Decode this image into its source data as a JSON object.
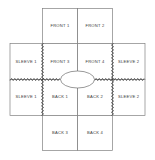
{
  "diagram": {
    "shape": "cruciform",
    "background_color": "#ffffff",
    "line_color": "#808080",
    "seam_color": "#2e2e2e",
    "label_color": "#3a3a3a",
    "neck_opening": {
      "name": "neck-opening",
      "shape": "ellipse",
      "cx": 77.5,
      "cy": 79.5,
      "rx": 17,
      "ry": 8.5
    },
    "panels": [
      {
        "id": "front-1",
        "label": "FRONT 1",
        "x": 42.5,
        "y": 8.5,
        "w": 35,
        "h": 35,
        "cx": 60,
        "cy": 26
      },
      {
        "id": "front-2",
        "label": "FRONT 2",
        "x": 77.5,
        "y": 8.5,
        "w": 35,
        "h": 35,
        "cx": 95,
        "cy": 26
      },
      {
        "id": "sleeve-1-upper",
        "label": "SLEEVE 1",
        "x": 10,
        "y": 43.5,
        "w": 32.5,
        "h": 36,
        "cx": 26.2,
        "cy": 62
      },
      {
        "id": "front-3",
        "label": "FRONT 3",
        "x": 42.5,
        "y": 43.5,
        "w": 35,
        "h": 36,
        "cx": 60,
        "cy": 62
      },
      {
        "id": "front-4",
        "label": "FRONT 4",
        "x": 77.5,
        "y": 43.5,
        "w": 35,
        "h": 36,
        "cx": 95,
        "cy": 62
      },
      {
        "id": "sleeve-2-upper",
        "label": "SLEEVE 2",
        "x": 112.5,
        "y": 43.5,
        "w": 32.5,
        "h": 36,
        "cx": 128.7,
        "cy": 62
      },
      {
        "id": "sleeve-1-lower",
        "label": "SLEEVE 1",
        "x": 10,
        "y": 79.5,
        "w": 32.5,
        "h": 36,
        "cx": 26.2,
        "cy": 97
      },
      {
        "id": "back-1",
        "label": "BACK 1",
        "x": 42.5,
        "y": 79.5,
        "w": 35,
        "h": 36,
        "cx": 60,
        "cy": 97
      },
      {
        "id": "back-2",
        "label": "BACK 2",
        "x": 77.5,
        "y": 79.5,
        "w": 35,
        "h": 36,
        "cx": 95,
        "cy": 97
      },
      {
        "id": "sleeve-2-lower",
        "label": "SLEEVE 2",
        "x": 112.5,
        "y": 79.5,
        "w": 32.5,
        "h": 36,
        "cx": 128.7,
        "cy": 97
      },
      {
        "id": "back-3",
        "label": "BACK 3",
        "x": 42.5,
        "y": 115.5,
        "w": 35,
        "h": 35,
        "cx": 60,
        "cy": 133
      },
      {
        "id": "back-4",
        "label": "BACK 4",
        "x": 77.5,
        "y": 115.5,
        "w": 35,
        "h": 35,
        "cx": 95,
        "cy": 133
      }
    ],
    "seams": [
      {
        "id": "seam-left-vertical",
        "orientation": "vertical",
        "pos": 42.5,
        "start": 43.5,
        "end": 115.5
      },
      {
        "id": "seam-right-vertical",
        "orientation": "vertical",
        "pos": 112.5,
        "start": 43.5,
        "end": 115.5
      },
      {
        "id": "seam-left-horizontal",
        "orientation": "horizontal",
        "pos": 79.5,
        "start": 10,
        "end": 60.5
      },
      {
        "id": "seam-right-horizontal",
        "orientation": "horizontal",
        "pos": 79.5,
        "start": 94.5,
        "end": 145
      }
    ]
  }
}
